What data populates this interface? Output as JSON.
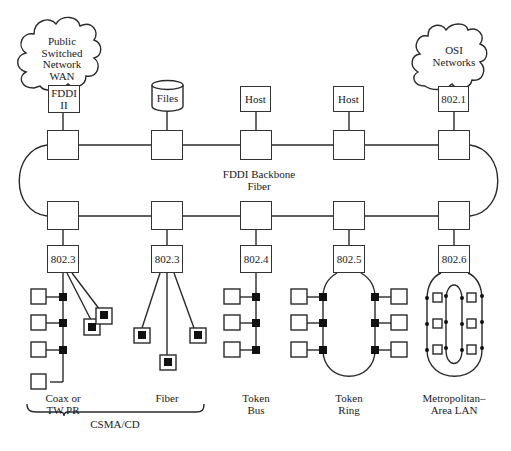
{
  "diagram": {
    "clouds": [
      {
        "id": "pswan",
        "lines": [
          "Public",
          "Switched",
          "Network",
          "WAN"
        ]
      },
      {
        "id": "osi",
        "lines": [
          "OSI",
          "Networks"
        ]
      }
    ],
    "top_devices": [
      {
        "label_lines": [
          "FDDI",
          "II"
        ],
        "type": "box"
      },
      {
        "label_lines": [
          "Files"
        ],
        "type": "cylinder"
      },
      {
        "label_lines": [
          "Host"
        ],
        "type": "box"
      },
      {
        "label_lines": [
          "Host"
        ],
        "type": "box"
      },
      {
        "label_lines": [
          "802.1"
        ],
        "type": "box"
      }
    ],
    "backbone": {
      "label_lines": [
        "FDDI Backbone",
        "Fiber"
      ]
    },
    "subnets": [
      {
        "standard": "802.3",
        "topology": "star-bus",
        "label_lines": [
          "Coax or",
          "TW PR"
        ]
      },
      {
        "standard": "802.3",
        "topology": "star",
        "label_lines": [
          "Fiber"
        ]
      },
      {
        "standard": "802.4",
        "topology": "bus",
        "label_lines": [
          "Token",
          "Bus"
        ]
      },
      {
        "standard": "802.5",
        "topology": "ring",
        "label_lines": [
          "Token",
          "Ring"
        ]
      },
      {
        "standard": "802.6",
        "topology": "dual-bus",
        "label_lines": [
          "Metropolitan–",
          "Area LAN"
        ]
      }
    ],
    "brace": {
      "label": "CSMA/CD",
      "spans": [
        "Coax or TW PR",
        "Fiber"
      ]
    }
  }
}
